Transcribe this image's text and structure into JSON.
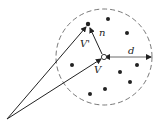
{
  "diagram": {
    "labels": {
      "v_prime": "V'",
      "v": "V",
      "n": "n",
      "d": "d"
    },
    "colors": {
      "stroke": "#222222",
      "dashed_circle": "#555555",
      "background": "#ffffff"
    },
    "circle": {
      "cx": 104,
      "cy": 57,
      "r": 48,
      "style": "dashed"
    },
    "origin": {
      "x": 7,
      "y": 119
    },
    "center_point": {
      "x": 104,
      "y": 57,
      "style": "hollow"
    },
    "target_point": {
      "x": 88,
      "y": 24
    },
    "dots": [
      {
        "x": 108,
        "y": 19
      },
      {
        "x": 127,
        "y": 33
      },
      {
        "x": 72,
        "y": 65
      },
      {
        "x": 137,
        "y": 65
      },
      {
        "x": 120,
        "y": 72
      },
      {
        "x": 130,
        "y": 82
      },
      {
        "x": 105,
        "y": 89
      },
      {
        "x": 90,
        "y": 94
      }
    ]
  }
}
